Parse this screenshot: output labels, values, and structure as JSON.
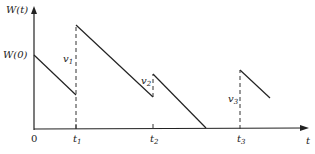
{
  "diagram": {
    "y_axis_label": "W(t)",
    "x_axis_label": "t",
    "initial_value_label": "W(0)",
    "origin_label": "0",
    "ticks": [
      {
        "label": "t",
        "sub": "1",
        "x": 76
      },
      {
        "label": "t",
        "sub": "2",
        "x": 153
      },
      {
        "label": "t",
        "sub": "3",
        "x": 240
      }
    ],
    "jumps": [
      {
        "label": "v",
        "sub": "1",
        "x": 76,
        "from_y": 95,
        "to_y": 25
      },
      {
        "label": "v",
        "sub": "2",
        "x": 153,
        "from_y": 97,
        "to_y": 74
      },
      {
        "label": "v",
        "sub": "3",
        "x": 240,
        "from_y": 129,
        "to_y": 70
      }
    ],
    "segments": [
      {
        "x1": 34,
        "y1": 55,
        "x2": 76,
        "y2": 95
      },
      {
        "x1": 76,
        "y1": 25,
        "x2": 153,
        "y2": 97
      },
      {
        "x1": 153,
        "y1": 74,
        "x2": 206,
        "y2": 128
      },
      {
        "x1": 240,
        "y1": 70,
        "x2": 270,
        "y2": 98
      }
    ]
  }
}
